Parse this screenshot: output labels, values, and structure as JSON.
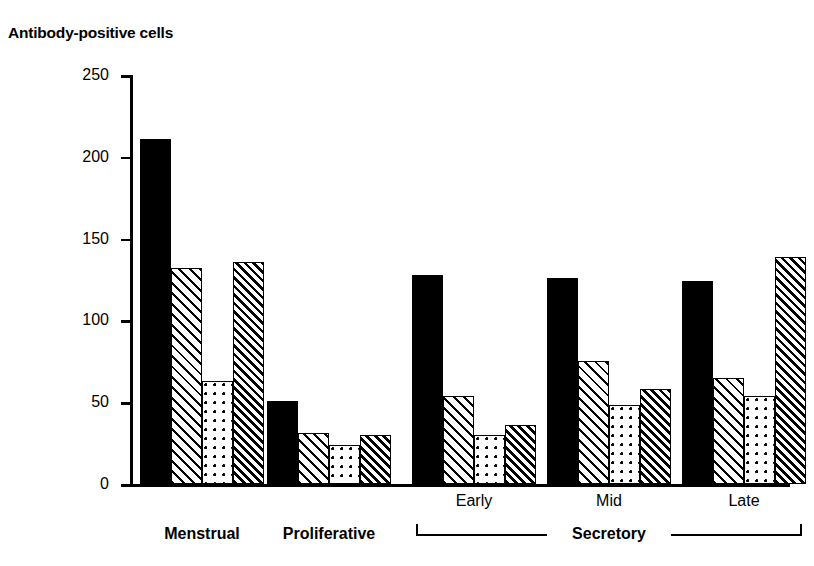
{
  "chart_data": {
    "type": "bar",
    "title": "Antibody-positive cells",
    "xlabel": "",
    "ylabel": "",
    "ylim": [
      0,
      250
    ],
    "yticks": [
      0,
      50,
      100,
      150,
      200,
      250
    ],
    "ytick_labels": [
      "0",
      "50",
      "100",
      "150",
      "200",
      "250"
    ],
    "grid": false,
    "legend": "none",
    "categories": [
      "Menstrual",
      "Proliferative",
      "Early",
      "Mid",
      "Late"
    ],
    "group_bracket": {
      "label": "Secretory",
      "spans": [
        "Early",
        "Mid",
        "Late"
      ]
    },
    "series": [
      {
        "name": "series-1",
        "pattern": "solid",
        "values": [
          211,
          51,
          128,
          126,
          124
        ]
      },
      {
        "name": "series-2",
        "pattern": "hatch-light",
        "values": [
          132,
          31,
          54,
          75,
          65
        ]
      },
      {
        "name": "series-3",
        "pattern": "dots",
        "values": [
          63,
          24,
          30,
          48,
          54
        ]
      },
      {
        "name": "series-4",
        "pattern": "hatch-dense",
        "values": [
          136,
          30,
          36,
          58,
          139
        ]
      }
    ]
  },
  "axis": {
    "tick_250": "250",
    "tick_200": "200",
    "tick_150": "150",
    "tick_100": "100",
    "tick_50": "50",
    "tick_0": "0"
  },
  "labels": {
    "title": "Antibody-positive cells",
    "menstrual": "Menstrual",
    "proliferative": "Proliferative",
    "early": "Early",
    "mid": "Mid",
    "late": "Late",
    "secretory": "Secretory"
  },
  "colors": {
    "ink": "#000000",
    "paper": "#ffffff"
  }
}
